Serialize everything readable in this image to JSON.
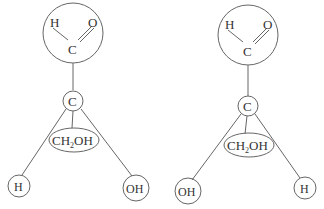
{
  "diagrams": [
    {
      "name": "left-isomer",
      "aldehyde": {
        "h": "H",
        "c": "C",
        "o": "O"
      },
      "center": "C",
      "top_group": "CH2OH",
      "left_group": "H",
      "right_group": "OH"
    },
    {
      "name": "right-isomer",
      "aldehyde": {
        "h": "H",
        "c": "C",
        "o": "O"
      },
      "center": "C",
      "top_group": "CH2OH",
      "left_group": "OH",
      "right_group": "H"
    }
  ],
  "colors": {
    "stroke": "#555555",
    "text": "#333333"
  }
}
